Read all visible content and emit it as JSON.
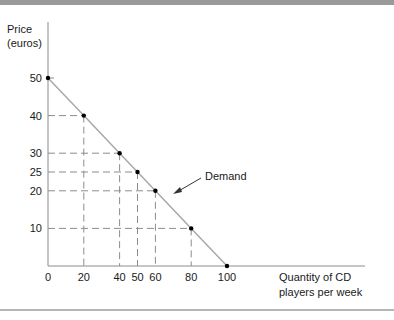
{
  "chart_data": {
    "type": "line",
    "title": "",
    "ylabel_lines": [
      "Price",
      "(euros)"
    ],
    "xlabel_lines": [
      "Quantity of CD",
      "players per week"
    ],
    "series": [
      {
        "name": "Demand",
        "points": [
          {
            "x": 0,
            "y": 50
          },
          {
            "x": 20,
            "y": 40
          },
          {
            "x": 40,
            "y": 30
          },
          {
            "x": 50,
            "y": 25
          },
          {
            "x": 60,
            "y": 20
          },
          {
            "x": 80,
            "y": 10
          },
          {
            "x": 100,
            "y": 0
          }
        ]
      }
    ],
    "xticks": [
      "0",
      "20",
      "40",
      "50",
      "60",
      "80",
      "100"
    ],
    "yticks": [
      "50",
      "40",
      "30",
      "25",
      "20",
      "10"
    ],
    "xlim": [
      0,
      100
    ],
    "ylim": [
      0,
      50
    ],
    "annotation": {
      "text": "Demand",
      "arrow": true
    },
    "grid": "dashed guide lines from each point to axes",
    "colors": {
      "line": "#a8a8a8",
      "axis": "#8c8c8c",
      "guides": "#8c8c8c",
      "points": "#000000"
    }
  }
}
